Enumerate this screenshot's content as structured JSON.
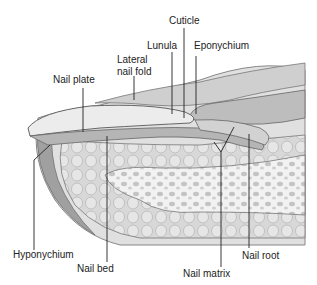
{
  "diagram": {
    "labels": {
      "cuticle": "Cuticle",
      "lunula": "Lunula",
      "eponychium": "Eponychium",
      "lateral_nail_fold_line1": "Lateral",
      "lateral_nail_fold_line2": "nail fold",
      "nail_plate": "Nail plate",
      "hyponychium": "Hyponychium",
      "nail_bed": "Nail bed",
      "nail_matrix": "Nail matrix",
      "nail_root": "Nail root"
    },
    "colors": {
      "skin_light": "#e2e2e2",
      "skin_mid": "#c9c9c9",
      "skin_dark": "#a8a8a8",
      "outline": "#555555",
      "bone": "#f0f0f0"
    }
  }
}
